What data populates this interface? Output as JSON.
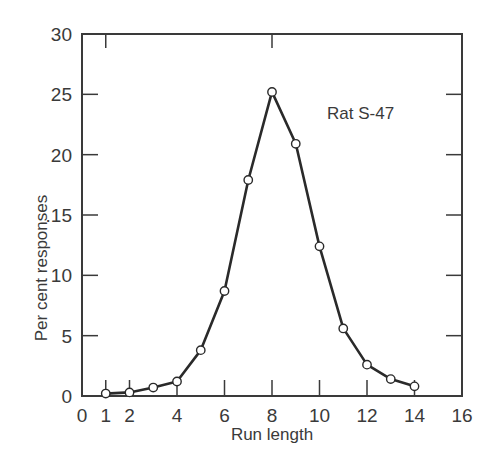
{
  "chart_data": {
    "type": "line",
    "title": "",
    "annotation": "Rat S-47",
    "xlabel": "Run length",
    "ylabel": "Per cent responses",
    "xlim": [
      0,
      16
    ],
    "ylim": [
      0,
      30
    ],
    "x_ticks": [
      0,
      1,
      2,
      4,
      6,
      8,
      10,
      12,
      14,
      16
    ],
    "y_ticks": [
      0,
      5,
      10,
      15,
      20,
      25,
      30
    ],
    "y_tick_labels": [
      "0",
      "5",
      "10",
      ".15",
      "20",
      "25",
      "30"
    ],
    "grid": false,
    "legend": null,
    "marker": "open-circle",
    "series": [
      {
        "name": "Rat S-47",
        "x": [
          1,
          2,
          3,
          4,
          5,
          6,
          7,
          8,
          9,
          10,
          11,
          12,
          13,
          14
        ],
        "values": [
          0.2,
          0.3,
          0.7,
          1.2,
          3.8,
          8.7,
          17.9,
          25.2,
          20.9,
          12.4,
          5.6,
          2.6,
          1.4,
          0.8
        ]
      }
    ]
  },
  "colors": {
    "line": "#2a2a2a",
    "marker_fill": "#ffffff",
    "axis": "#3a3a3a",
    "background": "#ffffff"
  }
}
